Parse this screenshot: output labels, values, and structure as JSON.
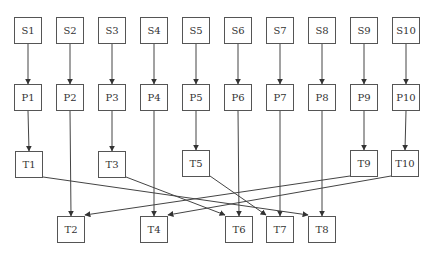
{
  "diagram": {
    "type": "flowchart",
    "rows": {
      "source": [
        "S1",
        "S2",
        "S3",
        "S4",
        "S5",
        "S6",
        "S7",
        "S8",
        "S9",
        "S10"
      ],
      "process": [
        "P1",
        "P2",
        "P3",
        "P4",
        "P5",
        "P6",
        "P7",
        "P8",
        "P9",
        "P10"
      ],
      "target_upper": [
        "T1",
        "T3",
        "T5",
        "T9",
        "T10"
      ],
      "target_lower": [
        "T2",
        "T4",
        "T6",
        "T7",
        "T8"
      ]
    },
    "nodes": [
      {
        "id": "S1",
        "label": "S1",
        "x": 14,
        "y": 17
      },
      {
        "id": "S2",
        "label": "S2",
        "x": 56,
        "y": 17
      },
      {
        "id": "S3",
        "label": "S3",
        "x": 98,
        "y": 17
      },
      {
        "id": "S4",
        "label": "S4",
        "x": 140,
        "y": 17
      },
      {
        "id": "S5",
        "label": "S5",
        "x": 182,
        "y": 17
      },
      {
        "id": "S6",
        "label": "S6",
        "x": 224,
        "y": 17
      },
      {
        "id": "S7",
        "label": "S7",
        "x": 266,
        "y": 17
      },
      {
        "id": "S8",
        "label": "S8",
        "x": 308,
        "y": 17
      },
      {
        "id": "S9",
        "label": "S9",
        "x": 350,
        "y": 17
      },
      {
        "id": "S10",
        "label": "S10",
        "x": 392,
        "y": 17
      },
      {
        "id": "P1",
        "label": "P1",
        "x": 14,
        "y": 84
      },
      {
        "id": "P2",
        "label": "P2",
        "x": 56,
        "y": 84
      },
      {
        "id": "P3",
        "label": "P3",
        "x": 98,
        "y": 84
      },
      {
        "id": "P4",
        "label": "P4",
        "x": 140,
        "y": 84
      },
      {
        "id": "P5",
        "label": "P5",
        "x": 182,
        "y": 84
      },
      {
        "id": "P6",
        "label": "P6",
        "x": 224,
        "y": 84
      },
      {
        "id": "P7",
        "label": "P7",
        "x": 266,
        "y": 84
      },
      {
        "id": "P8",
        "label": "P8",
        "x": 308,
        "y": 84
      },
      {
        "id": "P9",
        "label": "P9",
        "x": 350,
        "y": 84
      },
      {
        "id": "P10",
        "label": "P10",
        "x": 392,
        "y": 84
      },
      {
        "id": "T1",
        "label": "T1",
        "x": 15,
        "y": 151
      },
      {
        "id": "T3",
        "label": "T3",
        "x": 98,
        "y": 151
      },
      {
        "id": "T5",
        "label": "T5",
        "x": 182,
        "y": 150
      },
      {
        "id": "T9",
        "label": "T9",
        "x": 350,
        "y": 150
      },
      {
        "id": "T10",
        "label": "T10",
        "x": 391,
        "y": 150
      },
      {
        "id": "T2",
        "label": "T2",
        "x": 57,
        "y": 216
      },
      {
        "id": "T4",
        "label": "T4",
        "x": 140,
        "y": 216
      },
      {
        "id": "T6",
        "label": "T6",
        "x": 225,
        "y": 216
      },
      {
        "id": "T7",
        "label": "T7",
        "x": 266,
        "y": 216
      },
      {
        "id": "T8",
        "label": "T8",
        "x": 308,
        "y": 216
      }
    ],
    "edges": [
      {
        "from": "S1",
        "to": "P1"
      },
      {
        "from": "S2",
        "to": "P2"
      },
      {
        "from": "S3",
        "to": "P3"
      },
      {
        "from": "S4",
        "to": "P4"
      },
      {
        "from": "S5",
        "to": "P5"
      },
      {
        "from": "S6",
        "to": "P6"
      },
      {
        "from": "S7",
        "to": "P7"
      },
      {
        "from": "S8",
        "to": "P8"
      },
      {
        "from": "S9",
        "to": "P9"
      },
      {
        "from": "S10",
        "to": "P10"
      },
      {
        "from": "P1",
        "to": "T1"
      },
      {
        "from": "P2",
        "to": "T2"
      },
      {
        "from": "P3",
        "to": "T3"
      },
      {
        "from": "P4",
        "to": "T4"
      },
      {
        "from": "P5",
        "to": "T5"
      },
      {
        "from": "P6",
        "to": "T6"
      },
      {
        "from": "P7",
        "to": "T7"
      },
      {
        "from": "P8",
        "to": "T8"
      },
      {
        "from": "P9",
        "to": "T9"
      },
      {
        "from": "P10",
        "to": "T10"
      },
      {
        "from": "T1",
        "to": "T8"
      },
      {
        "from": "T3",
        "to": "T6"
      },
      {
        "from": "T5",
        "to": "T7"
      },
      {
        "from": "T9",
        "to": "T2"
      },
      {
        "from": "T10",
        "to": "T4"
      }
    ],
    "colors": {
      "line": "#444444",
      "border": "#555555",
      "text": "#333333"
    }
  }
}
